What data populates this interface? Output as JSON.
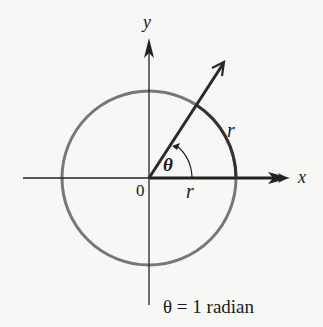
{
  "diagram": {
    "axes": {
      "x_label": "x",
      "y_label": "y",
      "origin_label": "0"
    },
    "circle": {
      "radius_label_on_axis": "r",
      "arc_label": "r",
      "color": "#777777"
    },
    "angle": {
      "symbol": "θ",
      "radians": 1
    },
    "caption": "θ = 1 radian",
    "colors": {
      "axes": "#222222",
      "ray": "#2a2a2a",
      "background": "#f7f7f5"
    }
  }
}
